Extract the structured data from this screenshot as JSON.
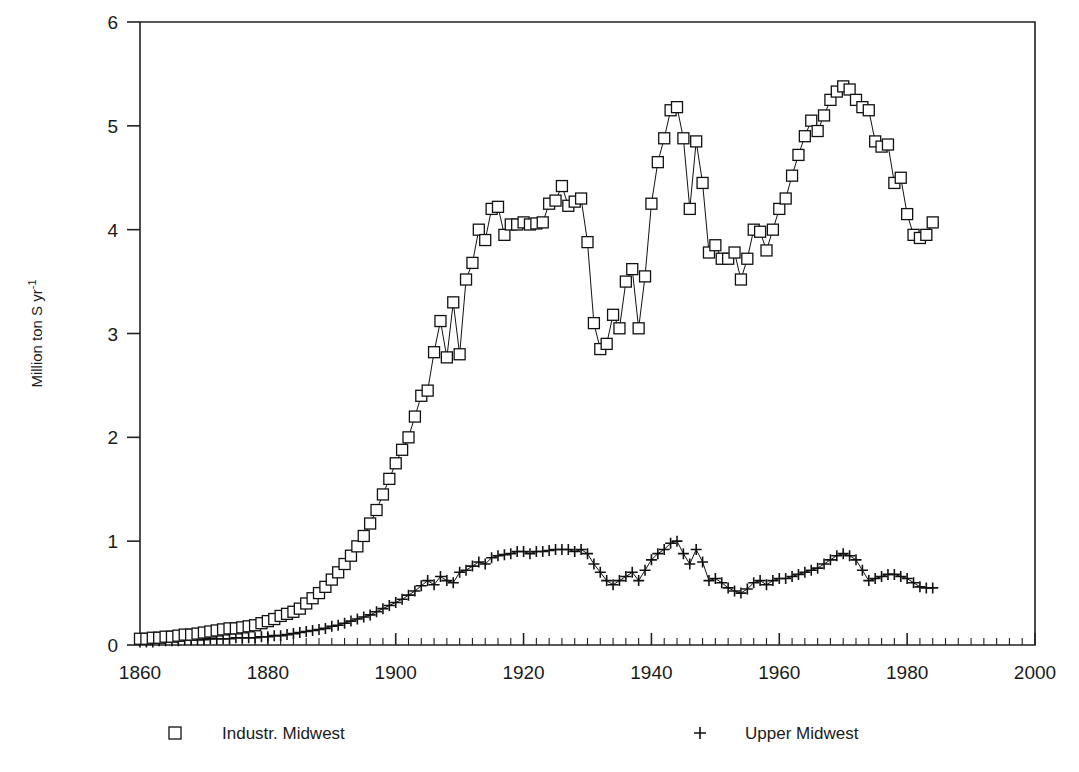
{
  "chart_data": {
    "type": "line",
    "title": "",
    "subtitle": "",
    "xlabel": "",
    "ylabel": "Million ton S yr-1",
    "ylabel_display": "Million ton S yr",
    "ylabel_exponent": "-1",
    "xlim": [
      1860,
      2000
    ],
    "ylim": [
      0,
      6
    ],
    "x_ticks_major": [
      1860,
      1880,
      1900,
      1920,
      1940,
      1960,
      1980,
      2000
    ],
    "x_tick_labels": [
      "1860",
      "1880",
      "1900",
      "1920",
      "1940",
      "1960",
      "1980",
      "2000"
    ],
    "x_minor_tick_interval": 2,
    "y_ticks_major": [
      0,
      1,
      2,
      3,
      4,
      5,
      6
    ],
    "y_tick_labels": [
      "0",
      "1",
      "2",
      "3",
      "4",
      "5",
      "6"
    ],
    "grid": false,
    "legend_position": "below-plot",
    "marker_color": "#000000",
    "line_color": "#000000",
    "background": "#ffffff",
    "series": [
      {
        "name": "Industr. Midwest",
        "marker": "square",
        "x": [
          1860,
          1861,
          1862,
          1863,
          1864,
          1865,
          1866,
          1867,
          1868,
          1869,
          1870,
          1871,
          1872,
          1873,
          1874,
          1875,
          1876,
          1877,
          1878,
          1879,
          1880,
          1881,
          1882,
          1883,
          1884,
          1885,
          1886,
          1887,
          1888,
          1889,
          1890,
          1891,
          1892,
          1893,
          1894,
          1895,
          1896,
          1897,
          1898,
          1899,
          1900,
          1901,
          1902,
          1903,
          1904,
          1905,
          1906,
          1907,
          1908,
          1909,
          1910,
          1911,
          1912,
          1913,
          1914,
          1915,
          1916,
          1917,
          1918,
          1919,
          1920,
          1921,
          1922,
          1923,
          1924,
          1925,
          1926,
          1927,
          1928,
          1929,
          1930,
          1931,
          1932,
          1933,
          1934,
          1935,
          1936,
          1937,
          1938,
          1939,
          1940,
          1941,
          1942,
          1943,
          1944,
          1945,
          1946,
          1947,
          1948,
          1949,
          1950,
          1951,
          1952,
          1953,
          1954,
          1955,
          1956,
          1957,
          1958,
          1959,
          1960,
          1961,
          1962,
          1963,
          1964,
          1965,
          1966,
          1967,
          1968,
          1969,
          1970,
          1971,
          1972,
          1973,
          1974,
          1975,
          1976,
          1977,
          1978,
          1979,
          1980,
          1981,
          1982,
          1983,
          1984
        ],
        "values": [
          0.06,
          0.06,
          0.07,
          0.07,
          0.08,
          0.08,
          0.09,
          0.1,
          0.1,
          0.11,
          0.12,
          0.13,
          0.14,
          0.15,
          0.16,
          0.16,
          0.17,
          0.18,
          0.19,
          0.21,
          0.23,
          0.25,
          0.28,
          0.3,
          0.32,
          0.35,
          0.4,
          0.45,
          0.5,
          0.56,
          0.63,
          0.7,
          0.78,
          0.86,
          0.95,
          1.05,
          1.17,
          1.3,
          1.45,
          1.6,
          1.75,
          1.88,
          2.0,
          2.2,
          2.4,
          2.45,
          2.82,
          3.12,
          2.77,
          3.3,
          2.8,
          3.52,
          3.68,
          4.0,
          3.9,
          4.2,
          4.22,
          3.95,
          4.05,
          4.05,
          4.07,
          4.05,
          4.06,
          4.07,
          4.25,
          4.28,
          4.42,
          4.23,
          4.27,
          4.3,
          3.88,
          3.1,
          2.85,
          2.9,
          3.18,
          3.05,
          3.5,
          3.62,
          3.05,
          3.55,
          4.25,
          4.65,
          4.88,
          5.15,
          5.18,
          4.88,
          4.2,
          4.85,
          4.45,
          3.78,
          3.85,
          3.72,
          3.72,
          3.78,
          3.52,
          3.72,
          4.0,
          3.98,
          3.8,
          4.0,
          4.2,
          4.3,
          4.52,
          4.72,
          4.9,
          5.05,
          4.95,
          5.1,
          5.25,
          5.33,
          5.38,
          5.35,
          5.25,
          5.18,
          5.15,
          4.85,
          4.8,
          4.82,
          4.45,
          4.5,
          4.15,
          3.95,
          3.92,
          3.95,
          4.07
        ]
      },
      {
        "name": "Upper Midwest",
        "marker": "plus",
        "x": [
          1860,
          1861,
          1862,
          1863,
          1864,
          1865,
          1866,
          1867,
          1868,
          1869,
          1870,
          1871,
          1872,
          1873,
          1874,
          1875,
          1876,
          1877,
          1878,
          1879,
          1880,
          1881,
          1882,
          1883,
          1884,
          1885,
          1886,
          1887,
          1888,
          1889,
          1890,
          1891,
          1892,
          1893,
          1894,
          1895,
          1896,
          1897,
          1898,
          1899,
          1900,
          1901,
          1902,
          1903,
          1904,
          1905,
          1906,
          1907,
          1908,
          1909,
          1910,
          1911,
          1912,
          1913,
          1914,
          1915,
          1916,
          1917,
          1918,
          1919,
          1920,
          1921,
          1922,
          1923,
          1924,
          1925,
          1926,
          1927,
          1928,
          1929,
          1930,
          1931,
          1932,
          1933,
          1934,
          1935,
          1936,
          1937,
          1938,
          1939,
          1940,
          1941,
          1942,
          1943,
          1944,
          1945,
          1946,
          1947,
          1948,
          1949,
          1950,
          1951,
          1952,
          1953,
          1954,
          1955,
          1956,
          1957,
          1958,
          1959,
          1960,
          1961,
          1962,
          1963,
          1964,
          1965,
          1966,
          1967,
          1968,
          1969,
          1970,
          1971,
          1972,
          1973,
          1974,
          1975,
          1976,
          1977,
          1978,
          1979,
          1980,
          1981,
          1982,
          1983,
          1984
        ],
        "values": [
          0.03,
          0.03,
          0.03,
          0.04,
          0.04,
          0.04,
          0.04,
          0.05,
          0.05,
          0.05,
          0.05,
          0.06,
          0.06,
          0.06,
          0.06,
          0.07,
          0.07,
          0.07,
          0.07,
          0.08,
          0.08,
          0.09,
          0.09,
          0.1,
          0.11,
          0.12,
          0.13,
          0.14,
          0.15,
          0.16,
          0.18,
          0.19,
          0.21,
          0.23,
          0.25,
          0.27,
          0.29,
          0.32,
          0.35,
          0.38,
          0.41,
          0.44,
          0.48,
          0.52,
          0.57,
          0.62,
          0.58,
          0.66,
          0.62,
          0.6,
          0.7,
          0.72,
          0.76,
          0.8,
          0.78,
          0.84,
          0.86,
          0.87,
          0.88,
          0.9,
          0.9,
          0.88,
          0.9,
          0.9,
          0.91,
          0.92,
          0.92,
          0.92,
          0.9,
          0.92,
          0.88,
          0.78,
          0.7,
          0.62,
          0.58,
          0.62,
          0.66,
          0.7,
          0.62,
          0.72,
          0.82,
          0.88,
          0.92,
          0.98,
          1.0,
          0.88,
          0.78,
          0.92,
          0.8,
          0.62,
          0.64,
          0.6,
          0.55,
          0.52,
          0.5,
          0.54,
          0.6,
          0.62,
          0.58,
          0.62,
          0.64,
          0.64,
          0.66,
          0.68,
          0.7,
          0.72,
          0.74,
          0.78,
          0.82,
          0.86,
          0.88,
          0.86,
          0.82,
          0.72,
          0.62,
          0.64,
          0.66,
          0.68,
          0.68,
          0.66,
          0.64,
          0.6,
          0.56,
          0.55,
          0.55
        ]
      }
    ],
    "legend": [
      {
        "label": "Industr. Midwest",
        "marker": "square"
      },
      {
        "label": "Upper Midwest",
        "marker": "plus"
      }
    ]
  }
}
